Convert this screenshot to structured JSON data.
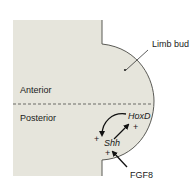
{
  "diagram": {
    "labels": {
      "limb_bud": "Limb bud",
      "anterior": "Anterior",
      "posterior": "Posterior",
      "hoxd": "HoxD",
      "shh": "Shh",
      "fgf8": "FGF8"
    },
    "signs": {
      "hoxd_plus": "+",
      "shh_left_plus": "+",
      "shh_below_plus": "+"
    },
    "colors": {
      "tissue_fill": "#e6e5dc",
      "outline": "#5a5a55",
      "arrow": "#111111",
      "text": "#1a1a1a"
    }
  }
}
